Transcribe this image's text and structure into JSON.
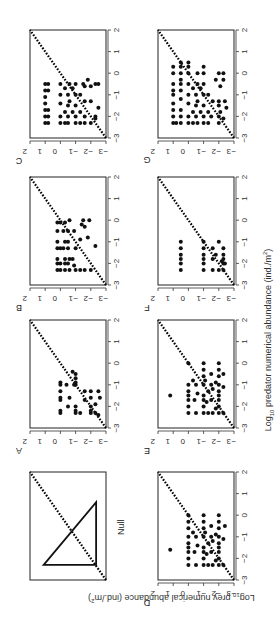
{
  "figure": {
    "x_axis_title_prefix": "Log",
    "x_axis_title_sub": "10",
    "x_axis_title_rest": " predator numerical abundance (ind./m",
    "x_axis_title_sup": "2",
    "x_axis_title_end": ")",
    "y_axis_title_prefix": "Log",
    "y_axis_title_sub": "10",
    "y_axis_title_rest": " prey numerical abundance (ind./m",
    "y_axis_title_sup": "2",
    "y_axis_title_end": ")",
    "null_label": "Null",
    "tick_labels": [
      "-3",
      "-2",
      "-1",
      "0",
      "1",
      "2"
    ],
    "colors": {
      "points": "#111111",
      "frame": "#222222",
      "text": "#333333"
    }
  },
  "chart_data": [
    {
      "panel": "Null",
      "type": "diagram",
      "description": "Schematic: 1:1 dotted diagonal with a right triangle below it",
      "xlim": [
        -3,
        2
      ],
      "ylim": [
        -3,
        2
      ]
    },
    {
      "panel": "A",
      "type": "scatter",
      "xlabel": "Log10 predator numerical abundance (ind./m2)",
      "ylabel": "Log10 prey numerical abundance (ind./m2)",
      "xlim": [
        -3,
        2
      ],
      "ylim": [
        -3,
        2
      ],
      "reference_line": "y = x (dotted)",
      "points": [
        [
          -2.3,
          0
        ],
        [
          -2.3,
          -1
        ],
        [
          -2.3,
          -1.3
        ],
        [
          -2.3,
          -2
        ],
        [
          -2.3,
          -2.3
        ],
        [
          -2.2,
          0
        ],
        [
          -2.2,
          -1
        ],
        [
          -2.2,
          -2
        ],
        [
          -2,
          -0.5
        ],
        [
          -2,
          -1
        ],
        [
          -2,
          -2
        ],
        [
          -1.7,
          0
        ],
        [
          -1.7,
          -1.6
        ],
        [
          -1.6,
          0
        ],
        [
          -1.6,
          -0.6
        ],
        [
          -1.6,
          -2
        ],
        [
          -1.6,
          -2.6
        ],
        [
          -1.3,
          0
        ],
        [
          -1.3,
          -1.6
        ],
        [
          -1.3,
          -2
        ],
        [
          -1.3,
          -2.5
        ],
        [
          -1,
          0
        ],
        [
          -1,
          -0.4
        ],
        [
          -1,
          -0.9
        ],
        [
          -1,
          -1
        ],
        [
          -0.9,
          0
        ],
        [
          -0.9,
          -1
        ],
        [
          -0.7,
          -1
        ],
        [
          -0.5,
          -1
        ],
        [
          -0.4,
          -0.8
        ],
        [
          -1.9,
          -2.3
        ],
        [
          -2.4,
          -2.5
        ]
      ]
    },
    {
      "panel": "B",
      "type": "scatter",
      "xlim": [
        -3,
        2
      ],
      "ylim": [
        -3,
        2
      ],
      "reference_line": "y = x (dotted)",
      "points": [
        [
          -2.3,
          0.2
        ],
        [
          -2.3,
          0
        ],
        [
          -2.3,
          -0.3
        ],
        [
          -2.3,
          -0.6
        ],
        [
          -2.3,
          -1
        ],
        [
          -2.3,
          -1.3
        ],
        [
          -2.3,
          -1.6
        ],
        [
          -2.3,
          -2
        ],
        [
          -2,
          0.2
        ],
        [
          -2,
          0
        ],
        [
          -2,
          -0.3
        ],
        [
          -2,
          -0.5
        ],
        [
          -1.8,
          0.2
        ],
        [
          -1.8,
          -0.3
        ],
        [
          -1.8,
          -0.6
        ],
        [
          -1.8,
          -0.8
        ],
        [
          -1.3,
          0.2
        ],
        [
          -1.3,
          0
        ],
        [
          -1.3,
          -0.2
        ],
        [
          -1.3,
          -0.5
        ],
        [
          -1.3,
          -1
        ],
        [
          -1.2,
          -2.3
        ],
        [
          -1,
          0.2
        ],
        [
          -1,
          -0.3
        ],
        [
          -1,
          -0.5
        ],
        [
          -0.9,
          -1.3
        ],
        [
          -0.8,
          -1.8
        ],
        [
          -0.5,
          0.2
        ],
        [
          -0.5,
          -0.2
        ],
        [
          -0.5,
          -0.5
        ],
        [
          -0.5,
          -0.9
        ],
        [
          -0.3,
          -1.6
        ],
        [
          -0.1,
          0.2
        ],
        [
          -0.1,
          0
        ],
        [
          -0.1,
          -0.3
        ],
        [
          0,
          -0.6
        ],
        [
          0,
          -1.5
        ],
        [
          0,
          -1.9
        ],
        [
          -0.2,
          -1.4
        ],
        [
          -2.1,
          -0.9
        ]
      ]
    },
    {
      "panel": "C",
      "type": "scatter",
      "xlim": [
        -3,
        2
      ],
      "ylim": [
        -3,
        2
      ],
      "reference_line": "y = x (dotted)",
      "points": [
        [
          -2.3,
          1
        ],
        [
          -2.3,
          0.8
        ],
        [
          -2.3,
          0
        ],
        [
          -2.3,
          -0.3
        ],
        [
          -2.3,
          -0.5
        ],
        [
          -2.3,
          -1
        ],
        [
          -2.3,
          -1.3
        ],
        [
          -2.3,
          -1.6
        ],
        [
          -2.3,
          -2
        ],
        [
          -2,
          1
        ],
        [
          -2,
          0.8
        ],
        [
          -2,
          0
        ],
        [
          -2,
          -0.5
        ],
        [
          -2,
          -1
        ],
        [
          -2,
          -1.6
        ],
        [
          -2,
          -2.3
        ],
        [
          -1.8,
          -0.3
        ],
        [
          -1.8,
          -0.8
        ],
        [
          -1.8,
          -1.3
        ],
        [
          -1.7,
          1
        ],
        [
          -1.7,
          0.8
        ],
        [
          -1.5,
          -0.5
        ],
        [
          -1.5,
          -1
        ],
        [
          -1.4,
          1
        ],
        [
          -1.4,
          0
        ],
        [
          -1.3,
          -0.6
        ],
        [
          -1.3,
          -1.6
        ],
        [
          -1.3,
          -2
        ],
        [
          -1.1,
          1
        ],
        [
          -1,
          0
        ],
        [
          -1,
          -0.5
        ],
        [
          -1,
          -1
        ],
        [
          -1,
          -1.3
        ],
        [
          -0.8,
          1
        ],
        [
          -0.8,
          0.8
        ],
        [
          -0.7,
          -0.3
        ],
        [
          -0.7,
          -0.8
        ],
        [
          -0.6,
          -1.6
        ],
        [
          -0.6,
          -2
        ],
        [
          -0.5,
          1
        ],
        [
          -0.5,
          0.8
        ],
        [
          -0.5,
          0
        ],
        [
          -0.5,
          -0.6
        ],
        [
          -0.5,
          -1
        ],
        [
          -0.5,
          -1.5
        ],
        [
          -0.5,
          -2.3
        ],
        [
          -0.3,
          -1.8
        ],
        [
          -1.6,
          -2.5
        ],
        [
          -0.5,
          -2.5
        ],
        [
          -2.1,
          -2.3
        ]
      ]
    },
    {
      "panel": "D",
      "type": "scatter",
      "xlim": [
        -3,
        2
      ],
      "ylim": [
        -3,
        2
      ],
      "reference_line": "y = x (dotted)",
      "points": [
        [
          -2.3,
          0
        ],
        [
          -2.3,
          -0.5
        ],
        [
          -2.3,
          -1
        ],
        [
          -2.3,
          -1.3
        ],
        [
          -2.3,
          -1.6
        ],
        [
          -2.3,
          -2
        ],
        [
          -2.3,
          -2.3
        ],
        [
          -2,
          0
        ],
        [
          -2,
          -1
        ],
        [
          -2,
          -2
        ],
        [
          -1.7,
          0
        ],
        [
          -1.7,
          -0.4
        ],
        [
          -1.7,
          -1
        ],
        [
          -1.7,
          -1.5
        ],
        [
          -1.7,
          -2
        ],
        [
          -1.6,
          1.2
        ],
        [
          -1.5,
          0
        ],
        [
          -1.5,
          -1
        ],
        [
          -1.5,
          -2
        ],
        [
          -1.4,
          -0.6
        ],
        [
          -1.3,
          0
        ],
        [
          -1.3,
          -1.3
        ],
        [
          -1.3,
          -2
        ],
        [
          -1.2,
          -1.6
        ],
        [
          -1,
          0
        ],
        [
          -1,
          -0.5
        ],
        [
          -1,
          -1
        ],
        [
          -1,
          -1.5
        ],
        [
          -1,
          -2
        ],
        [
          -0.9,
          -1.8
        ],
        [
          -0.8,
          -0.3
        ],
        [
          -0.8,
          -1.1
        ],
        [
          -0.6,
          0
        ],
        [
          -0.6,
          -1
        ],
        [
          -0.6,
          -2
        ],
        [
          -0.5,
          -1.5
        ],
        [
          -0.3,
          0
        ],
        [
          -0.3,
          -1
        ],
        [
          -0.3,
          -2
        ],
        [
          0,
          0
        ],
        [
          0,
          -1
        ],
        [
          0,
          -2
        ],
        [
          -1.8,
          -1.2
        ],
        [
          -2.1,
          -1.8
        ],
        [
          -1.1,
          -2.3
        ],
        [
          -0.5,
          -2.4
        ]
      ]
    },
    {
      "panel": "E",
      "type": "scatter",
      "xlim": [
        -3,
        2
      ],
      "ylim": [
        -3,
        2
      ],
      "reference_line": "y = x (dotted)",
      "points": [
        [
          -2.3,
          0
        ],
        [
          -2.3,
          -0.5
        ],
        [
          -2.3,
          -1
        ],
        [
          -2.3,
          -1.3
        ],
        [
          -2.3,
          -1.6
        ],
        [
          -2.3,
          -2
        ],
        [
          -2.3,
          -2.3
        ],
        [
          -2,
          0
        ],
        [
          -2,
          -1
        ],
        [
          -2,
          -2
        ],
        [
          -1.7,
          0
        ],
        [
          -1.7,
          -0.4
        ],
        [
          -1.7,
          -1
        ],
        [
          -1.7,
          -1.5
        ],
        [
          -1.7,
          -2
        ],
        [
          -1.5,
          1.2
        ],
        [
          -1.5,
          0
        ],
        [
          -1.5,
          -1
        ],
        [
          -1.5,
          -2
        ],
        [
          -1.4,
          -0.6
        ],
        [
          -1.3,
          0
        ],
        [
          -1.3,
          -1.3
        ],
        [
          -1.3,
          -2
        ],
        [
          -1.2,
          -1.6
        ],
        [
          -1,
          0
        ],
        [
          -1,
          -0.5
        ],
        [
          -1,
          -1
        ],
        [
          -1,
          -1.5
        ],
        [
          -1,
          -2
        ],
        [
          -0.9,
          -1.8
        ],
        [
          -0.8,
          -0.3
        ],
        [
          -0.8,
          -1.1
        ],
        [
          -0.6,
          -1
        ],
        [
          -0.6,
          -2
        ],
        [
          -0.5,
          -1.5
        ],
        [
          -0.3,
          -1
        ],
        [
          -0.3,
          -2
        ],
        [
          0,
          0
        ],
        [
          0,
          -1
        ],
        [
          0,
          -2
        ],
        [
          -1.8,
          -1.2
        ],
        [
          -2.1,
          -1.8
        ],
        [
          -1.1,
          -2.3
        ],
        [
          -0.5,
          -2.3
        ]
      ]
    },
    {
      "panel": "F",
      "type": "scatter",
      "xlim": [
        -3,
        2
      ],
      "ylim": [
        -3,
        2
      ],
      "reference_line": "y = x (dotted)",
      "points": [
        [
          -2.3,
          0.5
        ],
        [
          -2.3,
          -1
        ],
        [
          -2.3,
          -1.6
        ],
        [
          -2.3,
          -2
        ],
        [
          -2.3,
          -2.3
        ],
        [
          -2,
          0.5
        ],
        [
          -2,
          -1
        ],
        [
          -2,
          -2.3
        ],
        [
          -1.8,
          0.5
        ],
        [
          -1.8,
          -1
        ],
        [
          -1.8,
          -1.6
        ],
        [
          -1.6,
          0.5
        ],
        [
          -1.6,
          -1
        ],
        [
          -1.6,
          -1.8
        ],
        [
          -1.6,
          -2.3
        ],
        [
          -1.3,
          0.5
        ],
        [
          -1.3,
          -1
        ],
        [
          -1.3,
          -1.6
        ],
        [
          -1.3,
          -2.3
        ],
        [
          -1,
          0.5
        ],
        [
          -1,
          -1
        ],
        [
          -1,
          -2
        ],
        [
          -1.9,
          -2.2
        ],
        [
          -2,
          -2.4
        ],
        [
          -1.8,
          -2.3
        ]
      ]
    },
    {
      "panel": "G",
      "type": "scatter",
      "xlim": [
        -3,
        2
      ],
      "ylim": [
        -3,
        2
      ],
      "reference_line": "y = x (dotted)",
      "points": [
        [
          -2.3,
          1
        ],
        [
          -2.3,
          0.8
        ],
        [
          -2.3,
          0.5
        ],
        [
          -2.3,
          0
        ],
        [
          -2.3,
          -0.3
        ],
        [
          -2.3,
          -0.6
        ],
        [
          -2.3,
          -1
        ],
        [
          -2.3,
          -1.3
        ],
        [
          -2.3,
          -2
        ],
        [
          -2,
          1
        ],
        [
          -2,
          0.5
        ],
        [
          -2,
          0
        ],
        [
          -2,
          -0.5
        ],
        [
          -2,
          -1
        ],
        [
          -2,
          -1.5
        ],
        [
          -2,
          -2
        ],
        [
          -1.8,
          -0.3
        ],
        [
          -1.8,
          -0.8
        ],
        [
          -1.8,
          -1.3
        ],
        [
          -1.7,
          1
        ],
        [
          -1.7,
          0.5
        ],
        [
          -1.5,
          -0.5
        ],
        [
          -1.5,
          -1
        ],
        [
          -1.5,
          -2
        ],
        [
          -1.4,
          1
        ],
        [
          -1.4,
          0
        ],
        [
          -1.3,
          -0.6
        ],
        [
          -1.3,
          -1.6
        ],
        [
          -1.3,
          -2
        ],
        [
          -1.2,
          0.5
        ],
        [
          -1,
          1
        ],
        [
          -1,
          0
        ],
        [
          -1,
          -0.5
        ],
        [
          -1,
          -1
        ],
        [
          -1,
          -1.3
        ],
        [
          -0.8,
          1
        ],
        [
          -0.8,
          0.5
        ],
        [
          -0.7,
          -0.3
        ],
        [
          -0.7,
          -0.8
        ],
        [
          -0.5,
          1
        ],
        [
          -0.5,
          0.5
        ],
        [
          -0.5,
          0
        ],
        [
          -0.5,
          -0.6
        ],
        [
          -0.5,
          -1
        ],
        [
          -0.3,
          0.5
        ],
        [
          -0.3,
          -1.8
        ],
        [
          0,
          1
        ],
        [
          0,
          0.5
        ],
        [
          0,
          0
        ],
        [
          0,
          -0.6
        ],
        [
          0,
          -1
        ],
        [
          0,
          -2
        ],
        [
          0.3,
          1
        ],
        [
          0.3,
          0.5
        ],
        [
          0.3,
          0
        ],
        [
          0.3,
          -1
        ],
        [
          0.5,
          0.5
        ],
        [
          0.5,
          0
        ],
        [
          -1.6,
          -2.5
        ],
        [
          -1.3,
          -2.4
        ],
        [
          -0.3,
          -2.3
        ],
        [
          -2.1,
          -2.3
        ],
        [
          -0.6,
          -2.1
        ],
        [
          -1.8,
          -2.1
        ],
        [
          0,
          -2.3
        ]
      ]
    }
  ]
}
